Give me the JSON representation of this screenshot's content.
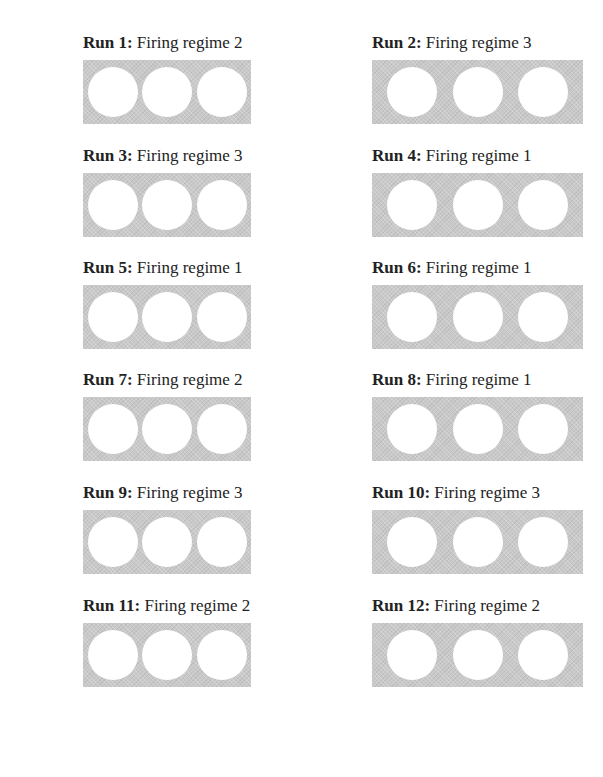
{
  "runs": [
    {
      "run": "Run 1:",
      "regime": "Firing regime 2"
    },
    {
      "run": "Run 2:",
      "regime": "Firing regime 3"
    },
    {
      "run": "Run 3:",
      "regime": "Firing regime 3"
    },
    {
      "run": "Run 4:",
      "regime": "Firing regime 1"
    },
    {
      "run": "Run 5:",
      "regime": "Firing regime 1"
    },
    {
      "run": "Run 6:",
      "regime": "Firing regime 1"
    },
    {
      "run": "Run 7:",
      "regime": "Firing regime 2"
    },
    {
      "run": "Run 8:",
      "regime": "Firing regime 1"
    },
    {
      "run": "Run 9:",
      "regime": "Firing regime 3"
    },
    {
      "run": "Run 10:",
      "regime": "Firing regime 3"
    },
    {
      "run": "Run 11:",
      "regime": "Firing regime 2"
    },
    {
      "run": "Run 12:",
      "regime": "Firing regime 2"
    }
  ],
  "holes_per_panel": 3,
  "colors": {
    "panel": "#c9c9c9",
    "hole": "#ffffff",
    "text": "#222222"
  }
}
